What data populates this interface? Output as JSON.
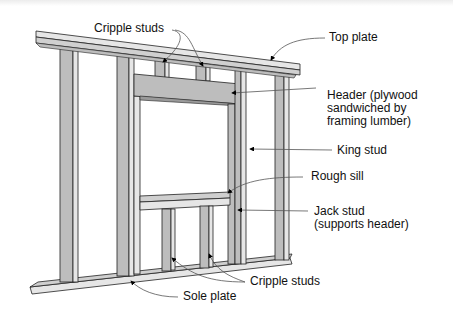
{
  "diagram": {
    "labels": {
      "cripple_studs_top": "Cripple studs",
      "top_plate": "Top plate",
      "header_line1": "Header (plywood",
      "header_line2": "sandwiched by",
      "header_line3": "framing lumber)",
      "king_stud": "King stud",
      "rough_sill": "Rough sill",
      "jack_stud_line1": "Jack stud",
      "jack_stud_line2": "(supports header)",
      "cripple_studs_bottom": "Cripple studs",
      "sole_plate": "Sole plate"
    },
    "colors": {
      "lumber_face": "#bdbdbd",
      "lumber_light": "#e6e6e6",
      "outline": "#222222",
      "arrow": "#000000"
    }
  }
}
